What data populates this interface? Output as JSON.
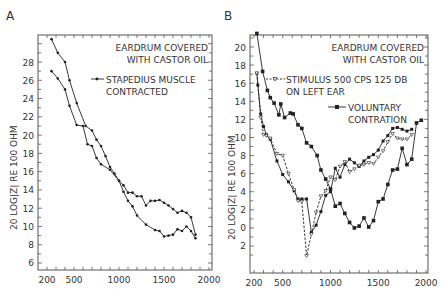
{
  "chart_data": [
    {
      "panel": "A",
      "type": "line",
      "title": "",
      "xlabel": "",
      "ylabel": "20 LOG|Z| RE 100 OHM",
      "xlim": [
        200,
        2000
      ],
      "ylim": [
        5,
        31
      ],
      "x_ticks": [
        200,
        500,
        1000,
        1500,
        2000
      ],
      "y_ticks": [
        6,
        8,
        10,
        12,
        14,
        16,
        18,
        20,
        22,
        24,
        26,
        28
      ],
      "annotations": [
        "EARDRUM COVERED",
        "WITH CASTOR OIL"
      ],
      "legend": [
        {
          "label": "STAPEDIUS MUSCLE",
          "label2": "CONTRACTED",
          "marker": "dot"
        }
      ],
      "series": [
        {
          "name": "baseline",
          "x": [
            250,
            320,
            400,
            450,
            530,
            630,
            700,
            750,
            800,
            850,
            900,
            950,
            1000,
            1050,
            1100,
            1150,
            1200,
            1300,
            1400,
            1450,
            1500,
            1550,
            1600,
            1650,
            1700,
            1750,
            1800,
            1850
          ],
          "y": [
            30.5,
            29,
            28,
            26,
            23.5,
            21,
            20.5,
            19.5,
            18.8,
            17.7,
            16.5,
            15.8,
            15,
            13.8,
            12.8,
            12.2,
            11.2,
            10.2,
            9.6,
            9.5,
            8.9,
            9,
            9.1,
            9.7,
            9.5,
            10,
            9.5,
            8.7
          ]
        },
        {
          "name": "stapedius_contracted",
          "x": [
            250,
            320,
            400,
            450,
            530,
            600,
            650,
            700,
            750,
            800,
            900,
            1000,
            1050,
            1100,
            1150,
            1200,
            1250,
            1300,
            1350,
            1400,
            1450,
            1500,
            1550,
            1600,
            1650,
            1700,
            1750,
            1800,
            1850
          ],
          "y": [
            27,
            26.2,
            25,
            23.2,
            21.1,
            21,
            19,
            18.8,
            17.5,
            16.8,
            16.2,
            15,
            14.5,
            13.7,
            13.7,
            13.3,
            13.3,
            12.3,
            12.8,
            12.8,
            12.9,
            12.6,
            12.3,
            11.9,
            11.5,
            11.7,
            11.5,
            11,
            9.1
          ]
        }
      ]
    },
    {
      "panel": "B",
      "type": "line",
      "title": "",
      "xlabel": "",
      "ylabel": "20 LOG|Z| RE 100 OHM",
      "xlim": [
        200,
        2000
      ],
      "ylim": [
        -3,
        23
      ],
      "x_ticks": [
        200,
        500,
        1000,
        1500,
        2000
      ],
      "y_ticks": [
        -2,
        0,
        2,
        4,
        6,
        8,
        10,
        12,
        14,
        16,
        18,
        20
      ],
      "y_tick_labels": [
        "2",
        "0",
        "2",
        "4",
        "6",
        "8",
        "10",
        "12",
        "14",
        "16",
        "18",
        "20"
      ],
      "annotations": [
        "EARDRUM COVERED",
        "WITH CASTOR OIL"
      ],
      "legend": [
        {
          "label": "STIMULUS  500 CPS  125 DB",
          "label2": "ON LEFT EAR",
          "marker": "open-triangle",
          "style": "dashed"
        },
        {
          "label": "VOLUNTARY",
          "label2": "CONTRATION",
          "marker": "filled-square",
          "style": "solid"
        }
      ],
      "series": [
        {
          "name": "baseline",
          "x": [
            230,
            240,
            270,
            300,
            330,
            370,
            440,
            500,
            560,
            620,
            660,
            700,
            750,
            800,
            850,
            900,
            950,
            1000,
            1050,
            1100,
            1150,
            1200,
            1250,
            1300,
            1350,
            1400,
            1450,
            1500,
            1550,
            1600,
            1650,
            1700,
            1750,
            1800,
            1850
          ],
          "y": [
            17.1,
            15.8,
            12.6,
            11.2,
            10.3,
            9.8,
            7.4,
            5.9,
            5.1,
            4.1,
            3.2,
            3.2,
            3.2,
            -0.5,
            0.3,
            1.8,
            3.6,
            4,
            6.6,
            5.6,
            7,
            7.6,
            7.2,
            6.8,
            7.4,
            7.8,
            8.1,
            8.6,
            9.6,
            10.2,
            11,
            11.1,
            10.9,
            10.7,
            10.9
          ]
        },
        {
          "name": "stimulus_500cps_125db",
          "x": [
            230,
            270,
            300,
            330,
            370,
            440,
            500,
            560,
            620,
            660,
            700,
            750,
            800,
            850,
            900,
            950,
            1000,
            1050,
            1100,
            1150,
            1200,
            1250,
            1300,
            1350,
            1400,
            1450,
            1500,
            1550,
            1600,
            1650,
            1700,
            1750,
            1800,
            1850
          ],
          "y": [
            17.1,
            12.2,
            10.3,
            10.2,
            9.9,
            8.2,
            8,
            6,
            4.2,
            3,
            2.9,
            -3.1,
            -0.7,
            1.7,
            3.5,
            4.1,
            5.6,
            5.3,
            6.8,
            7.3,
            6.2,
            6.5,
            6.9,
            7,
            7.2,
            7.1,
            7.8,
            8.5,
            9.5,
            10.4,
            9.9,
            9.8,
            9.8,
            10.3
          ]
        },
        {
          "name": "voluntary_contraction",
          "x": [
            230,
            290,
            340,
            370,
            410,
            460,
            480,
            520,
            580,
            610,
            660,
            700,
            750,
            800,
            860,
            900,
            950,
            1000,
            1050,
            1100,
            1150,
            1200,
            1250,
            1300,
            1350,
            1400,
            1450,
            1500,
            1550,
            1600,
            1650,
            1700,
            1750,
            1800,
            1850,
            1900,
            1950
          ],
          "y": [
            21.5,
            17.3,
            15.2,
            14.4,
            13.8,
            12.5,
            13.7,
            12.2,
            12.7,
            12.6,
            11.4,
            11,
            9.4,
            9,
            8,
            6.4,
            5.4,
            4.3,
            2.4,
            2.7,
            1.6,
            0.6,
            0,
            0.2,
            1.1,
            0.1,
            0.8,
            2.9,
            3.2,
            4.8,
            6.4,
            6.5,
            8.8,
            7,
            7.6,
            11.6,
            11.9
          ]
        }
      ]
    }
  ],
  "panels": {
    "a": {
      "label": "A",
      "annot1": "EARDRUM COVERED",
      "annot2": "WITH CASTOR OIL",
      "legend1a": "STAPEDIUS MUSCLE",
      "legend1b": "CONTRACTED",
      "ylabel": "20  LOG|Z|  RE  100  OHM",
      "xticks": [
        "200",
        "500",
        "1000",
        "1500",
        "2000"
      ],
      "yticks": [
        "28",
        "26",
        "24",
        "22",
        "20",
        "18",
        "16",
        "14",
        "12",
        "10",
        "8",
        "6"
      ]
    },
    "b": {
      "label": "B",
      "annot1": "EARDRUM COVERED",
      "annot2": "WITH CASTOR OIL",
      "legend1a": "STIMULUS  500 CPS  125 DB",
      "legend1b": "ON LEFT  EAR",
      "legend2a": "VOLUNTARY",
      "legend2b": "CONTRATION",
      "ylabel": "20  LOG|Z|  RE  100  OHM",
      "xticks": [
        "200",
        "500",
        "1000",
        "1500",
        "2000"
      ],
      "yticks": [
        "20",
        "18",
        "16",
        "14",
        "12",
        "10",
        "8",
        "6",
        "4",
        "2",
        "0",
        "2"
      ]
    }
  }
}
